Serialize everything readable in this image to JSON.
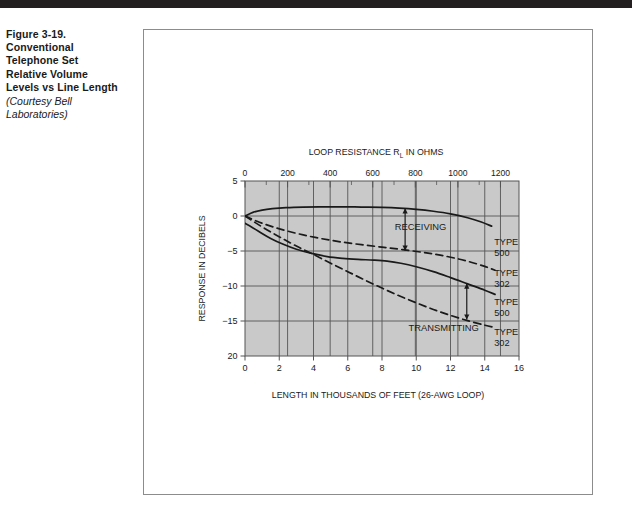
{
  "figure": {
    "caption_lines": [
      "Figure 3-19.",
      "Conventional",
      "Telephone Set",
      "Relative Volume",
      "Levels vs Line Length"
    ],
    "credit_lines": [
      "(Courtesy Bell",
      "Laboratories)"
    ]
  },
  "colors": {
    "plot_background": "#c9c9c9",
    "grid": "#555555",
    "curve": "#1a1a1a",
    "frame": "#8c8c8c",
    "top_bar": "#231f20",
    "text": "#1a1a1a"
  },
  "chart_data": {
    "type": "line",
    "title": "",
    "xlabel": "LENGTH IN THOUSANDS OF FEET (26-AWG LOOP)",
    "ylabel": "RESPONSE IN DECIBELS",
    "top_axis_label_parts": {
      "before": "LOOP RESISTANCE R",
      "subscript": "L",
      "after": " IN OHMS"
    },
    "xlim": [
      0,
      16
    ],
    "ylim": [
      -20,
      5
    ],
    "xticks": [
      0,
      2,
      4,
      6,
      8,
      10,
      12,
      14,
      16
    ],
    "xticklabels": [
      "0",
      "2",
      "4",
      "6",
      "8",
      "10",
      "12",
      "14",
      "16"
    ],
    "yticks": [
      5,
      0,
      -5,
      -10,
      -15,
      -20
    ],
    "yticklabels": [
      "5",
      "0",
      "−5",
      "−10",
      "−15",
      "20"
    ],
    "top_axis": {
      "label": "LOOP RESISTANCE RL IN OHMS",
      "lim": [
        0,
        1287
      ],
      "ticks": [
        0,
        200,
        400,
        600,
        800,
        1000,
        1200
      ],
      "ticklabels": [
        "0",
        "200",
        "400",
        "600",
        "800",
        "1000",
        "1200"
      ],
      "minor_step": 100
    },
    "grid": true,
    "legend_position": "right-inside",
    "series": [
      {
        "name": "RECEIVING TYPE 500",
        "style": "solid",
        "label": [
          "TYPE",
          "500"
        ],
        "label_x": 14.55,
        "label_y": -4.2,
        "points": [
          [
            0.0,
            0.0
          ],
          [
            0.5,
            0.55
          ],
          [
            1.0,
            0.85
          ],
          [
            1.6,
            1.05
          ],
          [
            2.4,
            1.2
          ],
          [
            3.4,
            1.28
          ],
          [
            4.5,
            1.3
          ],
          [
            5.6,
            1.3
          ],
          [
            6.8,
            1.28
          ],
          [
            8.0,
            1.22
          ],
          [
            9.0,
            1.12
          ],
          [
            10.0,
            0.95
          ],
          [
            11.0,
            0.68
          ],
          [
            12.0,
            0.3
          ],
          [
            13.0,
            -0.25
          ],
          [
            13.8,
            -0.85
          ],
          [
            14.4,
            -1.45
          ]
        ]
      },
      {
        "name": "RECEIVING TYPE 302",
        "style": "dashed",
        "label": [
          "TYPE",
          "302"
        ],
        "label_x": 14.55,
        "label_y": -8.6,
        "points": [
          [
            0.0,
            0.0
          ],
          [
            0.7,
            -0.75
          ],
          [
            1.5,
            -1.45
          ],
          [
            2.4,
            -2.1
          ],
          [
            3.4,
            -2.7
          ],
          [
            4.5,
            -3.25
          ],
          [
            5.6,
            -3.7
          ],
          [
            6.8,
            -4.1
          ],
          [
            8.0,
            -4.45
          ],
          [
            9.2,
            -4.8
          ],
          [
            10.4,
            -5.2
          ],
          [
            11.4,
            -5.6
          ],
          [
            12.4,
            -6.1
          ],
          [
            13.2,
            -6.6
          ],
          [
            14.0,
            -7.2
          ],
          [
            14.6,
            -7.75
          ]
        ]
      },
      {
        "name": "TRANSMITTING TYPE 500",
        "style": "solid",
        "label": [
          "TYPE",
          "500"
        ],
        "label_x": 14.55,
        "label_y": -12.7,
        "points": [
          [
            0.0,
            -1.05
          ],
          [
            0.4,
            -1.6
          ],
          [
            0.9,
            -2.35
          ],
          [
            1.5,
            -3.2
          ],
          [
            2.2,
            -4.0
          ],
          [
            3.0,
            -4.75
          ],
          [
            3.9,
            -5.35
          ],
          [
            4.8,
            -5.8
          ],
          [
            5.7,
            -6.05
          ],
          [
            6.6,
            -6.2
          ],
          [
            7.5,
            -6.3
          ],
          [
            8.3,
            -6.45
          ],
          [
            9.1,
            -6.75
          ],
          [
            10.0,
            -7.25
          ],
          [
            11.0,
            -7.95
          ],
          [
            12.0,
            -8.8
          ],
          [
            13.0,
            -9.7
          ],
          [
            14.0,
            -10.6
          ],
          [
            14.6,
            -11.2
          ]
        ]
      },
      {
        "name": "TRANSMITTING TYPE 302",
        "style": "dashed",
        "label": [
          "TYPE",
          "302"
        ],
        "label_x": 14.55,
        "label_y": -17.0,
        "points": [
          [
            0.0,
            0.0
          ],
          [
            0.6,
            -0.95
          ],
          [
            1.3,
            -2.0
          ],
          [
            2.1,
            -3.1
          ],
          [
            3.0,
            -4.3
          ],
          [
            4.0,
            -5.5
          ],
          [
            5.0,
            -6.75
          ],
          [
            6.0,
            -7.95
          ],
          [
            7.0,
            -9.15
          ],
          [
            8.0,
            -10.3
          ],
          [
            9.0,
            -11.4
          ],
          [
            10.0,
            -12.4
          ],
          [
            11.0,
            -13.35
          ],
          [
            12.0,
            -14.2
          ],
          [
            13.0,
            -14.95
          ],
          [
            14.0,
            -15.6
          ],
          [
            14.6,
            -15.95
          ]
        ]
      }
    ],
    "annotations": [
      {
        "name": "receiving",
        "text": "RECEIVING",
        "text_x": 10.25,
        "text_y": -2.05,
        "arrow_x": 9.35,
        "arrow_y_top": 1.1,
        "arrow_y_bottom": -4.95
      },
      {
        "name": "transmitting",
        "text": "TRANSMITTING",
        "text_x": 11.6,
        "text_y": -16.4,
        "arrow_x": 12.95,
        "arrow_y_top": -9.65,
        "arrow_y_bottom": -14.8
      }
    ]
  }
}
